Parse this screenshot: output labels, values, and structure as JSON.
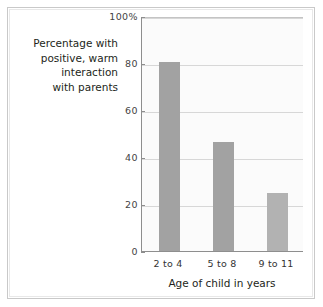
{
  "chart_data": {
    "type": "bar",
    "title": "",
    "subtitle": "",
    "xlabel": "Age of child in years",
    "ylabel": "Percentage with\npositive, warm\ninteraction\nwith parents",
    "categories": [
      "2 to 4",
      "5 to 8",
      "9 to 11"
    ],
    "values": [
      81,
      47,
      25
    ],
    "ylim": [
      0,
      100
    ],
    "ytick_values": [
      0,
      20,
      40,
      60,
      80,
      100
    ],
    "ytick_labels": [
      "0",
      "20",
      "40",
      "60",
      "80",
      "100%"
    ],
    "grid": true,
    "legend": "none",
    "bar_colors": [
      "#a2a2a2",
      "#a2a2a2",
      "#b2b2b2"
    ]
  },
  "colors": {
    "bar_fill": "#a2a2a2",
    "bar_fill_light": "#b2b2b2",
    "gridline": "#d7d7d7",
    "axis": "#8e8e8e",
    "plot_background": "#fbfbfb",
    "frame_border": "#c9c9c9",
    "text": "#231f20"
  }
}
